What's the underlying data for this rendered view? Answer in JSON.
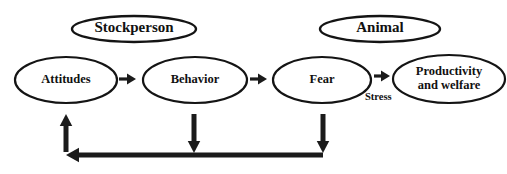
{
  "diagram": {
    "canvas": {
      "width": 507,
      "height": 174,
      "background": "#ffffff"
    },
    "stroke_color": "#141414",
    "text_color": "#111111",
    "group_nodes": [
      {
        "id": "stockperson",
        "label": "Stockperson",
        "cx": 134,
        "cy": 29,
        "rx": 62,
        "ry": 13,
        "stroke_width": 2.4
      },
      {
        "id": "animal",
        "label": "Animal",
        "cx": 380,
        "cy": 29,
        "rx": 60,
        "ry": 13,
        "stroke_width": 2.4
      }
    ],
    "stage_nodes": [
      {
        "id": "attitudes",
        "label": "Attitudes",
        "lines": [
          "Attitudes"
        ],
        "cx": 66,
        "cy": 80,
        "rx": 51,
        "ry": 23,
        "stroke_width": 2.2
      },
      {
        "id": "behavior",
        "label": "Behavior",
        "lines": [
          "Behavior"
        ],
        "cx": 195,
        "cy": 80,
        "rx": 52,
        "ry": 23,
        "stroke_width": 2.2
      },
      {
        "id": "fear",
        "label": "Fear",
        "lines": [
          "Fear"
        ],
        "cx": 322,
        "cy": 80,
        "rx": 49,
        "ry": 23,
        "stroke_width": 2.2
      },
      {
        "id": "productivity-and-welfare",
        "label": "Productivity and welfare",
        "lines": [
          "Productivity",
          "and welfare"
        ],
        "cx": 449,
        "cy": 79,
        "rx": 56,
        "ry": 24,
        "stroke_width": 2.2
      }
    ],
    "forward_arrows": [
      {
        "id": "attitudes-to-behavior",
        "from": "attitudes",
        "to": "behavior",
        "x1": 119,
        "x2": 136,
        "y": 79,
        "width": 3.2,
        "head": 9
      },
      {
        "id": "behavior-to-fear",
        "from": "behavior",
        "to": "fear",
        "x1": 250,
        "x2": 267,
        "y": 79,
        "width": 3.2,
        "head": 9
      },
      {
        "id": "fear-to-productivity",
        "from": "fear",
        "to": "productivity-and-welfare",
        "x1": 374,
        "x2": 390,
        "y": 76,
        "width": 3.2,
        "head": 9
      }
    ],
    "edge_labels": [
      {
        "id": "stress-label",
        "text": "Stress",
        "x": 365,
        "y": 98
      }
    ],
    "feedback": {
      "id": "feedback-loop",
      "line_y": 155,
      "line_x_left": 66,
      "line_x_right": 323,
      "line_width": 5,
      "up_arrow": {
        "id": "feedback-to-attitudes",
        "x": 66,
        "y_top": 114,
        "y_bottom": 152,
        "width": 5,
        "head": 12
      },
      "down_arrows": [
        {
          "id": "behavior-to-feedback",
          "x": 194,
          "y_top": 114,
          "y_bottom": 153,
          "width": 5,
          "head": 12
        },
        {
          "id": "fear-to-feedback",
          "x": 323,
          "y_top": 114,
          "y_bottom": 153,
          "width": 5,
          "head": 12
        }
      ],
      "head_left": {
        "x": 66,
        "y": 155,
        "size": 13
      }
    }
  }
}
